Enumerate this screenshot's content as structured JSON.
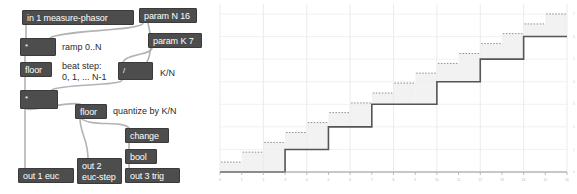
{
  "patch": {
    "title": "euclidean-rhythm-pd-patch",
    "objects": [
      {
        "id": "in1",
        "label": "in 1 measure-phasor",
        "x": 22,
        "y": 10,
        "w": 112,
        "h": 15,
        "kind": "inlet"
      },
      {
        "id": "paramN",
        "label": "param N 16",
        "x": 139,
        "y": 8,
        "w": 58,
        "h": 15,
        "kind": "object"
      },
      {
        "id": "paramK",
        "label": "param K 7",
        "x": 148,
        "y": 33,
        "w": 54,
        "h": 15,
        "kind": "object"
      },
      {
        "id": "mul1",
        "label": "*",
        "x": 20,
        "y": 38,
        "w": 36,
        "h": 18,
        "kind": "object"
      },
      {
        "id": "floor1",
        "label": "floor",
        "x": 20,
        "y": 62,
        "w": 32,
        "h": 15,
        "kind": "object"
      },
      {
        "id": "div1",
        "label": "/",
        "x": 118,
        "y": 62,
        "w": 35,
        "h": 18,
        "kind": "object"
      },
      {
        "id": "mul2",
        "label": "*",
        "x": 20,
        "y": 90,
        "w": 38,
        "h": 19,
        "kind": "object"
      },
      {
        "id": "floor2",
        "label": "floor",
        "x": 75,
        "y": 104,
        "w": 32,
        "h": 15,
        "kind": "object"
      },
      {
        "id": "change",
        "label": "change",
        "x": 125,
        "y": 128,
        "w": 44,
        "h": 15,
        "kind": "object"
      },
      {
        "id": "bool",
        "label": "bool",
        "x": 125,
        "y": 149,
        "w": 32,
        "h": 15,
        "kind": "object"
      },
      {
        "id": "out1",
        "label": "out 1 euc",
        "x": 18,
        "y": 168,
        "w": 56,
        "h": 15,
        "kind": "outlet"
      },
      {
        "id": "out2",
        "label": "out 2\neuc-step",
        "x": 77,
        "y": 158,
        "w": 45,
        "h": 26,
        "kind": "outlet"
      },
      {
        "id": "out3",
        "label": "out 3 trig",
        "x": 125,
        "y": 168,
        "w": 55,
        "h": 15,
        "kind": "outlet"
      }
    ],
    "comments": [
      {
        "id": "c-ramp",
        "label": "ramp 0..N",
        "x": 62,
        "y": 42
      },
      {
        "id": "c-beatstep",
        "label": "beat step:\n0, 1, ... N-1",
        "x": 62,
        "y": 62
      },
      {
        "id": "c-kn",
        "label": "K/N",
        "x": 160,
        "y": 67
      },
      {
        "id": "c-quantize",
        "label": "quantize by K/N",
        "x": 113,
        "y": 106
      }
    ],
    "colors": {
      "object_fill": "#4d4d4d",
      "object_text": "#ffffff",
      "comment_text": "#2b2b2b",
      "wire": "#b0b0b0"
    }
  },
  "chart_data": {
    "type": "line",
    "title": "",
    "xlabel": "",
    "ylabel": "",
    "xlim": [
      0,
      16
    ],
    "ylim": [
      0,
      7
    ],
    "grid": true,
    "legend": null,
    "x_ticks": [
      0,
      1,
      2,
      3,
      4,
      5,
      6,
      7,
      8,
      9,
      10,
      11,
      12,
      13,
      14,
      15,
      16
    ],
    "y_ticks": [
      0,
      1,
      2,
      3,
      4,
      5,
      6,
      7
    ],
    "x_gridlines": [
      0,
      2,
      4,
      6,
      8,
      10,
      12,
      14,
      16
    ],
    "y_gridlines": [
      0,
      1,
      2,
      3,
      4,
      5,
      6,
      7
    ],
    "series": [
      {
        "name": "euc-step (quantized floor(K/N * step))",
        "style": "step-solid",
        "color": "#555555",
        "x": [
          0,
          1,
          2,
          3,
          4,
          5,
          6,
          7,
          8,
          9,
          10,
          11,
          12,
          13,
          14,
          15,
          16
        ],
        "values": [
          0,
          0,
          0,
          1,
          1,
          2,
          2,
          3,
          3,
          3,
          4,
          4,
          5,
          5,
          6,
          6,
          7
        ]
      },
      {
        "name": "ramp K/N * step (dotted)",
        "style": "step-dotted",
        "color": "#8f8f8f",
        "x": [
          0,
          1,
          2,
          3,
          4,
          5,
          6,
          7,
          8,
          9,
          10,
          11,
          12,
          13,
          14,
          15,
          16
        ],
        "values": [
          0.0,
          0.44,
          0.88,
          1.31,
          1.75,
          2.19,
          2.63,
          3.06,
          3.5,
          3.94,
          4.38,
          4.81,
          5.25,
          5.69,
          6.13,
          6.56,
          7.0
        ]
      }
    ],
    "shaded_steps": {
      "name": "step fill bands",
      "color": "#eeeeee",
      "opacity": 0.75
    }
  }
}
